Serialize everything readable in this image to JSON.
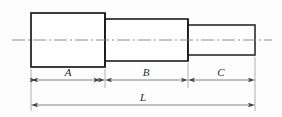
{
  "drawing": {
    "title": "Stepped shaft dimensioned sketch",
    "background_color": "#fdfdfd",
    "outline_color": "#1c1c1c",
    "dimension_color": "#555555",
    "centerline_color": "#777777",
    "label_color": "#2b2b2b",
    "part": {
      "type": "stepped-shaft",
      "view": "front-elevation",
      "section_count": 3,
      "sections": [
        {
          "id": "section-a",
          "label": "A",
          "x_start": 31,
          "x_end": 105,
          "top": 13,
          "bottom": 67,
          "relative_length": "largest diameter"
        },
        {
          "id": "section-b",
          "label": "B",
          "x_start": 105,
          "x_end": 188,
          "top": 19,
          "bottom": 61,
          "relative_length": "medium diameter"
        },
        {
          "id": "section-c",
          "label": "C",
          "x_start": 188,
          "x_end": 255,
          "top": 25,
          "bottom": 55,
          "relative_length": "smallest diameter"
        }
      ]
    },
    "centerline": {
      "id": "axis-centerline",
      "style": "dash-dot",
      "y": 40,
      "x_start": 12,
      "x_end": 272
    },
    "dimensions": [
      {
        "id": "dimension-a",
        "label": "A",
        "y": 80,
        "x_start": 31,
        "x_end": 105,
        "arrow_direction": "inward"
      },
      {
        "id": "dimension-b",
        "label": "B",
        "y": 80,
        "x_start": 105,
        "x_end": 188,
        "arrow_direction": "inward"
      },
      {
        "id": "dimension-c",
        "label": "C",
        "y": 80,
        "x_start": 188,
        "x_end": 255,
        "arrow_direction": "inward"
      },
      {
        "id": "dimension-l",
        "label": "L",
        "y": 105,
        "x_start": 31,
        "x_end": 255,
        "arrow_direction": "inward"
      }
    ],
    "labels": {
      "a": "A",
      "b": "B",
      "c": "C",
      "l": "L"
    }
  }
}
